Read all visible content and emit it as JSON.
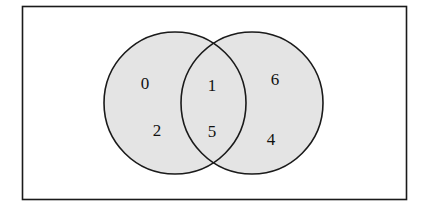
{
  "diagram": {
    "type": "venn",
    "universe": {
      "x": 22,
      "y": 6,
      "width": 384,
      "height": 194
    },
    "fill_color": "#e4e4e4",
    "stroke_color": "#1a1a1a",
    "sets": [
      {
        "name": "left-set",
        "cx": 175,
        "cy": 103,
        "r": 71
      },
      {
        "name": "right-set",
        "cx": 252,
        "cy": 103,
        "r": 71
      }
    ],
    "regions": {
      "left_only": [
        "0",
        "2"
      ],
      "intersection": [
        "1",
        "5"
      ],
      "right_only": [
        "6",
        "4"
      ]
    },
    "labels": [
      {
        "text": "0",
        "x": 145,
        "y": 89,
        "region": "left_only"
      },
      {
        "text": "2",
        "x": 157,
        "y": 136,
        "region": "left_only"
      },
      {
        "text": "1",
        "x": 212,
        "y": 91,
        "region": "intersection"
      },
      {
        "text": "5",
        "x": 212,
        "y": 137,
        "region": "intersection"
      },
      {
        "text": "6",
        "x": 275,
        "y": 85,
        "region": "right_only"
      },
      {
        "text": "4",
        "x": 271,
        "y": 145,
        "region": "right_only"
      }
    ]
  }
}
